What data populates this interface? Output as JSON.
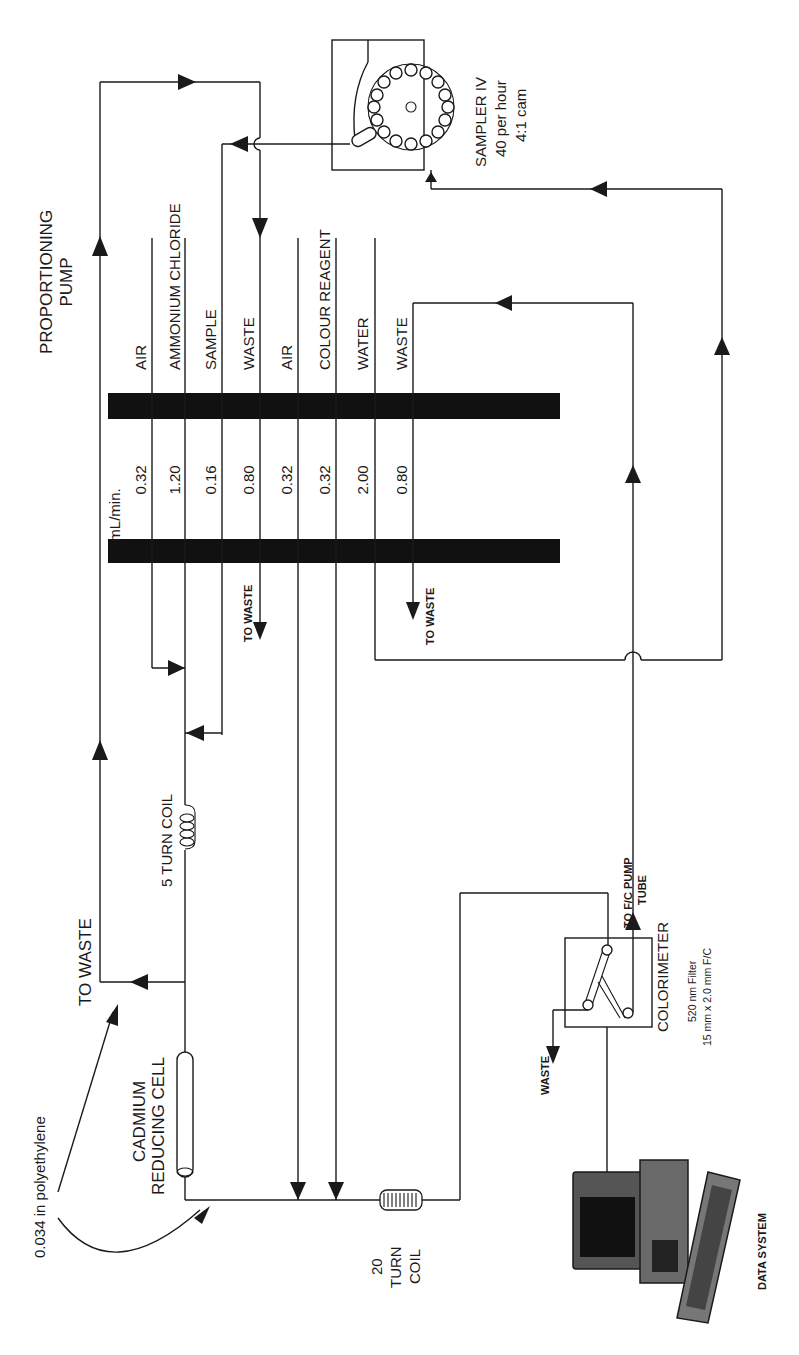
{
  "diagram": {
    "orientation": "rotated 90 degrees (text reads bottom-to-top)",
    "line_color": "#1a1a1a",
    "background": "#ffffff"
  },
  "pump": {
    "title_line1": "PROPORTIONING",
    "title_line2": "PUMP",
    "units": "mL/min.",
    "tubes": [
      {
        "label": "AIR",
        "rate": "0.32"
      },
      {
        "label": "AMMONIUM CHLORIDE",
        "rate": "1.20"
      },
      {
        "label": "SAMPLE",
        "rate": "0.16"
      },
      {
        "label": "WASTE",
        "rate": "0.80"
      },
      {
        "label": "AIR",
        "rate": "0.32"
      },
      {
        "label": "COLOUR REAGENT",
        "rate": "0.32"
      },
      {
        "label": "WATER",
        "rate": "2.00"
      },
      {
        "label": "WASTE",
        "rate": "0.80"
      }
    ],
    "to_waste_1": "TO WASTE",
    "to_waste_2": "TO WASTE"
  },
  "sampler": {
    "name": "SAMPLER IV",
    "rate": "40 per hour",
    "cam": "4:1 cam"
  },
  "manifold": {
    "five_turn_coil": "5 TURN COIL",
    "to_waste": "TO WASTE",
    "tubing_note": "0.034 in polyethylene",
    "cadmium_line1": "CADMIUM",
    "cadmium_line2": "REDUCING CELL",
    "twenty_turn_line1": "20",
    "twenty_turn_line2": "TURN",
    "twenty_turn_line3": "COIL"
  },
  "colorimeter": {
    "name": "COLORIMETER",
    "filter": "520 nm Filter",
    "flowcell": "15 mm x 2.0 mm F/C",
    "waste": "WASTE",
    "to_pump_line1": "TO F/C PUMP",
    "to_pump_line2": "TUBE"
  },
  "data_system": {
    "label": "DATA SYSTEM"
  }
}
